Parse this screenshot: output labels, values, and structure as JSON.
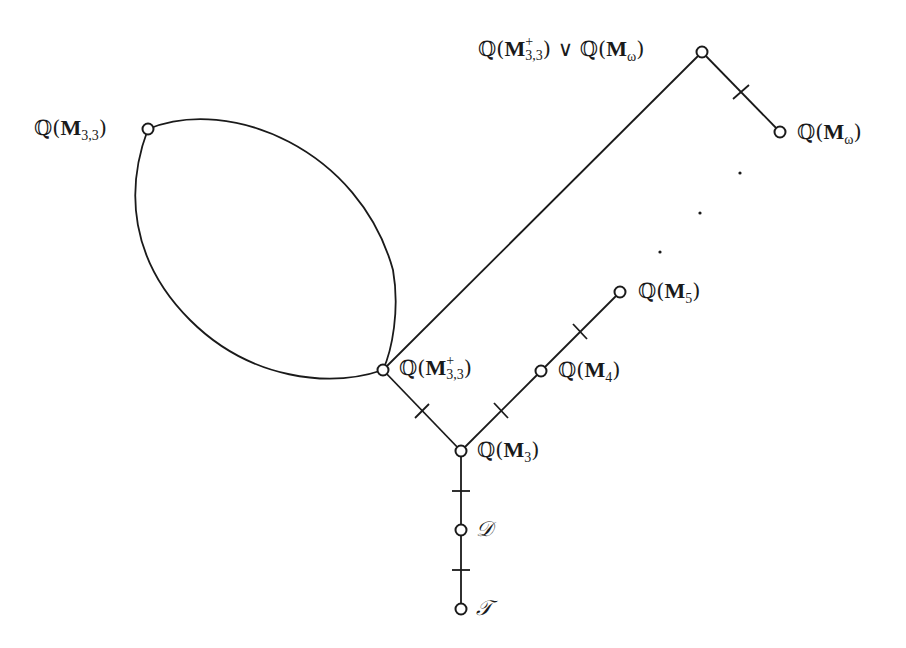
{
  "diagram": {
    "type": "lattice / Hasse diagram",
    "nodes": [
      {
        "id": "Q_M33",
        "label": "ℚ(M3,3)",
        "base": "M",
        "sub": "3,3",
        "sup": "",
        "x": 148,
        "y": 129,
        "label_side": "left"
      },
      {
        "id": "Q_M33plus_join_Q_Momega",
        "label": "ℚ(M+3,3) ∨ ℚ(Mω)",
        "x": 702,
        "y": 52,
        "label_side": "left"
      },
      {
        "id": "Q_Momega",
        "label": "ℚ(Mω)",
        "base": "M",
        "sub": "ω",
        "x": 780,
        "y": 132,
        "label_side": "right"
      },
      {
        "id": "Q_M33plus",
        "label": "ℚ(M+3,3)",
        "base": "M",
        "sub": "3,3",
        "sup": "+",
        "x": 383,
        "y": 370,
        "label_side": "right"
      },
      {
        "id": "Q_M5",
        "label": "ℚ(M5)",
        "base": "M",
        "sub": "5",
        "x": 620,
        "y": 292,
        "label_side": "right"
      },
      {
        "id": "Q_M4",
        "label": "ℚ(M4)",
        "base": "M",
        "sub": "4",
        "x": 541,
        "y": 371,
        "label_side": "right"
      },
      {
        "id": "Q_M3",
        "label": "ℚ(M3)",
        "base": "M",
        "sub": "3",
        "x": 461,
        "y": 451,
        "label_side": "right"
      },
      {
        "id": "D",
        "label": "𝒟",
        "x": 461,
        "y": 530,
        "label_side": "right"
      },
      {
        "id": "T",
        "label": "𝒯",
        "x": 461,
        "y": 609,
        "label_side": "right"
      }
    ],
    "edges": [
      {
        "from": "Q_M33",
        "to": "Q_M33plus",
        "style": "curve-upper",
        "covering_tick": false
      },
      {
        "from": "Q_M33",
        "to": "Q_M33plus",
        "style": "curve-lower",
        "covering_tick": false
      },
      {
        "from": "Q_M33plus",
        "to": "Q_M33plus_join_Q_Momega",
        "style": "straight",
        "covering_tick": false
      },
      {
        "from": "Q_M33plus_join_Q_Momega",
        "to": "Q_Momega",
        "style": "straight",
        "covering_tick": true
      },
      {
        "from": "Q_M3",
        "to": "Q_M33plus",
        "style": "straight",
        "covering_tick": true
      },
      {
        "from": "Q_M3",
        "to": "Q_M4",
        "style": "straight",
        "covering_tick": true
      },
      {
        "from": "Q_M4",
        "to": "Q_M5",
        "style": "straight",
        "covering_tick": true
      },
      {
        "from": "D",
        "to": "Q_M3",
        "style": "straight",
        "covering_tick": true
      },
      {
        "from": "T",
        "to": "D",
        "style": "straight",
        "covering_tick": true
      }
    ],
    "ellipsis_dots": [
      {
        "x": 740,
        "y": 173
      },
      {
        "x": 700,
        "y": 213
      },
      {
        "x": 660,
        "y": 252
      }
    ],
    "labels": {
      "q": "ℚ",
      "bold_m": "M",
      "join": "∨",
      "sub_33": "3,3",
      "sup_plus": "+",
      "sub_omega": "ω",
      "sub_5": "5",
      "sub_4": "4",
      "sub_3": "3",
      "D": "𝒟",
      "T": "𝒯",
      "open_paren": "(",
      "close_paren": ")"
    },
    "colors": {
      "stroke": "#1a1a1a",
      "background": "#ffffff"
    }
  }
}
